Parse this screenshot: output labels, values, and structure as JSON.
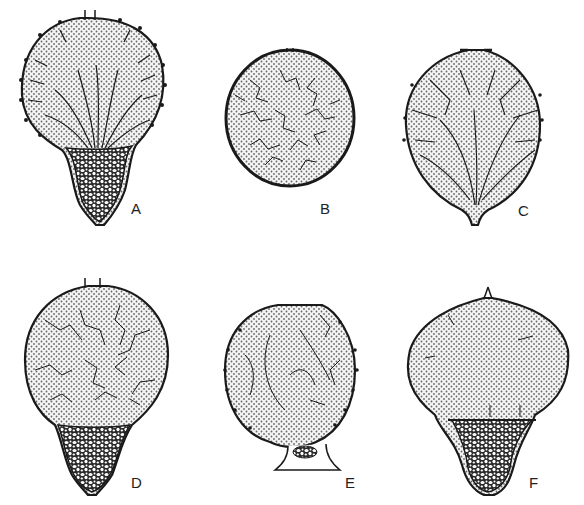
{
  "figure": {
    "type": "scientific-illustration",
    "panels": [
      {
        "id": "A",
        "label": "A",
        "shape": "pear",
        "interior": "radiating-fibers-over-stippled-lumen",
        "base": "cellular-sterile-tissue",
        "wall": "spiny",
        "ostiole": true
      },
      {
        "id": "B",
        "label": "B",
        "shape": "globose",
        "interior": "reticulate-branched-fibers",
        "base": "none",
        "wall": "smooth-thick",
        "ostiole": true
      },
      {
        "id": "C",
        "label": "C",
        "shape": "obovate",
        "interior": "radiating-branched-fibers",
        "base": "stalk",
        "wall": "sparsely-spiny",
        "ostiole": true
      },
      {
        "id": "D",
        "label": "D",
        "shape": "pear",
        "interior": "reticulate-fibers",
        "base": "cellular-sterile-tissue",
        "wall": "smooth",
        "ostiole": true
      },
      {
        "id": "E",
        "label": "E",
        "shape": "globose",
        "interior": "sparse-wavy-fibers",
        "base": "short-cellular-stalk",
        "wall": "spiny",
        "ostiole": true
      },
      {
        "id": "F",
        "label": "F",
        "shape": "oblate-on-funnel",
        "interior": "stippled-nearly-empty",
        "base": "cellular-sterile-tissue",
        "wall": "sparsely-spiny",
        "ostiole": true
      }
    ],
    "colors": {
      "ink": "#1a1a1a",
      "stipple": "#555555",
      "background": "#ffffff",
      "lumen": "#eeeeee"
    }
  }
}
